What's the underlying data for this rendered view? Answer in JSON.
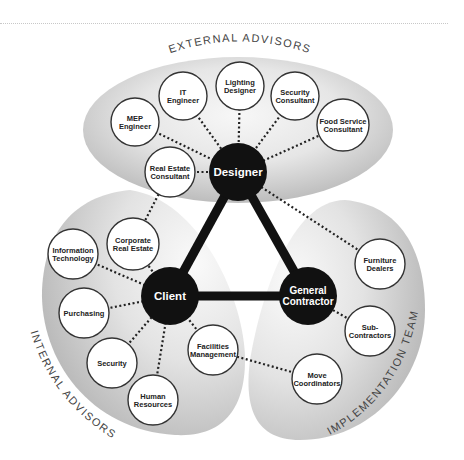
{
  "groups": {
    "external": {
      "label": "EXTERNAL ADVISORS"
    },
    "internal": {
      "label": "INTERNAL ADVISORS"
    },
    "implementation": {
      "label": "IMPLEMENTATION TEAM"
    }
  },
  "core_nodes": [
    {
      "id": "designer",
      "lines": [
        "Designer"
      ],
      "x": 238,
      "y": 172,
      "r": 29
    },
    {
      "id": "client",
      "lines": [
        "Client"
      ],
      "x": 170,
      "y": 296,
      "r": 29
    },
    {
      "id": "general-contractor",
      "lines": [
        "General",
        "Contractor"
      ],
      "x": 308,
      "y": 296,
      "r": 29
    }
  ],
  "core_links": [
    [
      "designer",
      "client"
    ],
    [
      "designer",
      "general-contractor"
    ],
    [
      "client",
      "general-contractor"
    ]
  ],
  "satellite_nodes": [
    {
      "id": "mep-engineer",
      "group": "external",
      "hub": "designer",
      "lines": [
        "MEP",
        "Engineer"
      ],
      "x": 135,
      "y": 122,
      "r": 24
    },
    {
      "id": "it-engineer",
      "group": "external",
      "hub": "designer",
      "lines": [
        "IT",
        "Engineer"
      ],
      "x": 183,
      "y": 96,
      "r": 24
    },
    {
      "id": "lighting-designer",
      "group": "external",
      "hub": "designer",
      "lines": [
        "Lighting",
        "Designer"
      ],
      "x": 240,
      "y": 86,
      "r": 24
    },
    {
      "id": "security-consultant",
      "group": "external",
      "hub": "designer",
      "lines": [
        "Security",
        "Consultant"
      ],
      "x": 295,
      "y": 96,
      "r": 24
    },
    {
      "id": "food-service-consultant",
      "group": "external",
      "hub": "designer",
      "lines": [
        "Food Service",
        "Consultant"
      ],
      "x": 343,
      "y": 125,
      "r": 26
    },
    {
      "id": "real-estate-consultant",
      "group": "external",
      "hub": "designer",
      "lines": [
        "Real Estate",
        "Consultant"
      ],
      "x": 170,
      "y": 172,
      "r": 25
    },
    {
      "id": "corporate-real-estate",
      "group": "internal",
      "hub": "real-estate-consultant",
      "lines": [
        "Corporate",
        "Real Estate"
      ],
      "x": 133,
      "y": 244,
      "r": 26
    },
    {
      "id": "information-technology",
      "group": "internal",
      "hub": "client",
      "lines": [
        "Information",
        "Technology"
      ],
      "x": 73,
      "y": 254,
      "r": 25
    },
    {
      "id": "purchasing",
      "group": "internal",
      "hub": "client",
      "lines": [
        "Purchasing"
      ],
      "x": 84,
      "y": 313,
      "r": 25
    },
    {
      "id": "security",
      "group": "internal",
      "hub": "client",
      "lines": [
        "Security"
      ],
      "x": 112,
      "y": 363,
      "r": 25
    },
    {
      "id": "human-resources",
      "group": "internal",
      "hub": "client",
      "lines": [
        "Human",
        "Resources"
      ],
      "x": 153,
      "y": 400,
      "r": 25
    },
    {
      "id": "facilities-management",
      "group": "internal",
      "hub": "client",
      "lines": [
        "Facilities",
        "Management"
      ],
      "x": 213,
      "y": 350,
      "r": 25
    },
    {
      "id": "furniture-dealers",
      "group": "implementation",
      "hub": "designer",
      "lines": [
        "Furniture",
        "Dealers"
      ],
      "x": 380,
      "y": 264,
      "r": 25
    },
    {
      "id": "sub-contractors",
      "group": "implementation",
      "hub": "general-contractor",
      "lines": [
        "Sub-",
        "Contractors"
      ],
      "x": 370,
      "y": 331,
      "r": 25
    },
    {
      "id": "move-coordinators",
      "group": "implementation",
      "hub": "facilities-management",
      "lines": [
        "Move",
        "Coordinators"
      ],
      "x": 317,
      "y": 379,
      "r": 25
    }
  ],
  "extra_links": [
    [
      "corporate-real-estate",
      "client"
    ]
  ],
  "colors": {
    "core_fill": "#111111",
    "satellite_fill": "#ffffff",
    "satellite_stroke": "#333333",
    "blob_dark": "#bdbdbd",
    "blob_light": "#f7f7f7",
    "dotted_link": "#222222"
  }
}
